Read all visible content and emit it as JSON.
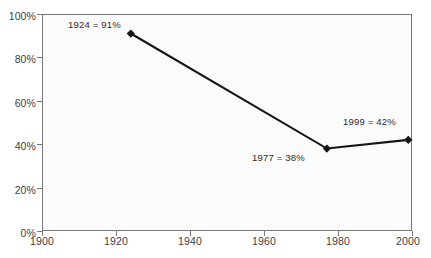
{
  "title_fragment": "",
  "colors": {
    "line": "#151518",
    "marker": "#151518",
    "frame": "#77777c",
    "plot_background": "#fbfbfc",
    "page_background": "#ffffff",
    "tick_label": "#404044",
    "annotation": "#2b2b2e"
  },
  "axes": {
    "y_ticks": [
      "0%",
      "20%",
      "40%",
      "60%",
      "80%",
      "100%"
    ],
    "x_ticks": [
      "1900",
      "1920",
      "1940",
      "1960",
      "1980",
      "2000"
    ]
  },
  "annotations": [
    {
      "text": "1924 = 91%"
    },
    {
      "text": "1977 = 38%"
    },
    {
      "text": "1999 = 42%"
    }
  ],
  "chart_data": {
    "type": "line",
    "title": "",
    "xlabel": "",
    "ylabel": "",
    "x": [
      1924,
      1977,
      1999
    ],
    "values": [
      91,
      38,
      42
    ],
    "point_labels": [
      "1924 = 91%",
      "1977 = 38%",
      "1999 = 42%"
    ],
    "xlim": [
      1900,
      2000
    ],
    "ylim": [
      0,
      100
    ],
    "x_tick_values": [
      1900,
      1920,
      1940,
      1960,
      1980,
      2000
    ],
    "y_tick_values": [
      0,
      20,
      40,
      60,
      80,
      100
    ],
    "x_tick_labels": [
      "1900",
      "1920",
      "1940",
      "1960",
      "1980",
      "2000"
    ],
    "y_tick_labels": [
      "0%",
      "20%",
      "40%",
      "60%",
      "80%",
      "100%"
    ],
    "grid": false,
    "legend": false,
    "marker": "diamond",
    "series": [
      {
        "name": "",
        "x": [
          1924,
          1977,
          1999
        ],
        "values": [
          91,
          38,
          42
        ]
      }
    ]
  }
}
